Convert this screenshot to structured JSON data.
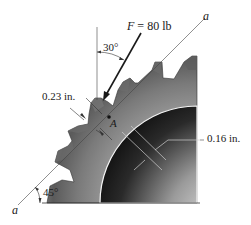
{
  "figure": {
    "force": {
      "symbol": "F",
      "eq": " = ",
      "value": "80 lb"
    },
    "angle_force": "30°",
    "angle_line": "45°",
    "dim_tooth": "0.23 in.",
    "dim_section": "0.16 in.",
    "point_label": "A",
    "line_label_top": "a",
    "line_label_bottom": "a"
  },
  "colors": {
    "gear_light": "#bdbdbd",
    "gear_dark": "#4a4a4a",
    "bore_dark": "#1e1e1e",
    "bore_light": "#e8e8e8",
    "line": "#333333"
  }
}
